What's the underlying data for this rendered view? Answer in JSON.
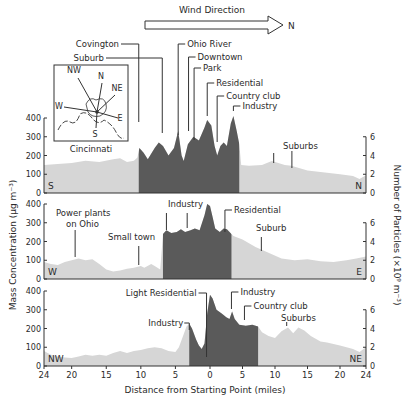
{
  "chart_data": {
    "type": "area",
    "title": "Wind Direction",
    "wind_arrow_label": "N",
    "xlabel": "Distance from Starting Point (miles)",
    "ylabel_left": "Mass Concentration (µg m⁻³)",
    "ylabel_right": "Number of Particles (×10⁹ m⁻³)",
    "x_ticks": [
      "24",
      "20",
      "15",
      "10",
      "5",
      "0",
      "5",
      "10",
      "15",
      "20",
      "24"
    ],
    "x_tick_values": [
      -24,
      -20,
      -15,
      -10,
      -5,
      0,
      5,
      10,
      15,
      20,
      24
    ],
    "y_left_ticks": [
      "0",
      "100",
      "200",
      "300",
      "400"
    ],
    "y_right_ticks": [
      "0",
      "2",
      "4",
      "6"
    ],
    "ylim_left": [
      0,
      400
    ],
    "ylim_right": [
      0,
      6
    ],
    "inset": {
      "label": "Cincinnati",
      "directions": [
        "NW",
        "N",
        "NE",
        "W",
        "E",
        "S"
      ]
    },
    "panels": [
      {
        "name": "S-N transect",
        "start_label": "S",
        "end_label": "N",
        "city_region_miles": [
          -10.3,
          4.5
        ],
        "profile": [
          [
            -24,
            150
          ],
          [
            -22,
            155
          ],
          [
            -20,
            160
          ],
          [
            -18,
            172
          ],
          [
            -16,
            165
          ],
          [
            -14,
            180
          ],
          [
            -13,
            185
          ],
          [
            -12,
            165
          ],
          [
            -11,
            172
          ],
          [
            -10.5,
            190
          ],
          [
            -10.2,
            240
          ],
          [
            -9.6,
            215
          ],
          [
            -9,
            180
          ],
          [
            -8,
            240
          ],
          [
            -7.4,
            270
          ],
          [
            -6.8,
            250
          ],
          [
            -6,
            200
          ],
          [
            -5.2,
            240
          ],
          [
            -4.6,
            330
          ],
          [
            -4.1,
            200
          ],
          [
            -3.8,
            170
          ],
          [
            -3.2,
            260
          ],
          [
            -2.4,
            300
          ],
          [
            -1.6,
            280
          ],
          [
            -0.8,
            350
          ],
          [
            -0.4,
            390
          ],
          [
            0.2,
            360
          ],
          [
            0.7,
            250
          ],
          [
            1.1,
            200
          ],
          [
            1.6,
            250
          ],
          [
            2.1,
            270
          ],
          [
            2.6,
            250
          ],
          [
            3.2,
            370
          ],
          [
            3.6,
            410
          ],
          [
            4.1,
            330
          ],
          [
            4.5,
            260
          ],
          [
            4.8,
            150
          ],
          [
            6,
            145
          ],
          [
            8,
            150
          ],
          [
            9.5,
            170
          ],
          [
            10.5,
            160
          ],
          [
            11.5,
            150
          ],
          [
            12.5,
            145
          ],
          [
            15,
            120
          ],
          [
            18,
            108
          ],
          [
            20,
            100
          ],
          [
            22,
            90
          ],
          [
            23,
            75
          ],
          [
            24,
            95
          ]
        ],
        "annotations": [
          {
            "label": "Covington",
            "x": -10.3
          },
          {
            "label": "Suburb",
            "x": -6.9
          },
          {
            "label": "Ohio River",
            "x": -4.6
          },
          {
            "label": "Downtown",
            "x": -3.1
          },
          {
            "label": "Park",
            "x": -2.3
          },
          {
            "label": "Residential",
            "x": -0.4
          },
          {
            "label": "Country club",
            "x": 1.1
          },
          {
            "label": "Industry",
            "x": 3.6
          },
          {
            "label": "Suburbs",
            "x": 9.8
          },
          {
            "label": "",
            "x": 12.6
          }
        ]
      },
      {
        "name": "W-E transect",
        "start_label": "W",
        "end_label": "E",
        "city_region_miles": [
          -6.8,
          3.3
        ],
        "profile": [
          [
            -24,
            90
          ],
          [
            -23,
            80
          ],
          [
            -22,
            75
          ],
          [
            -21,
            90
          ],
          [
            -20,
            100
          ],
          [
            -19,
            110
          ],
          [
            -18,
            100
          ],
          [
            -17,
            105
          ],
          [
            -16,
            80
          ],
          [
            -15,
            50
          ],
          [
            -14,
            40
          ],
          [
            -13,
            45
          ],
          [
            -12,
            55
          ],
          [
            -11,
            60
          ],
          [
            -10,
            70
          ],
          [
            -9.5,
            60
          ],
          [
            -8.5,
            80
          ],
          [
            -8,
            70
          ],
          [
            -7.2,
            50
          ],
          [
            -6.8,
            240
          ],
          [
            -6.3,
            260
          ],
          [
            -5.6,
            245
          ],
          [
            -4.8,
            250
          ],
          [
            -4.2,
            265
          ],
          [
            -3.6,
            250
          ],
          [
            -2.8,
            260
          ],
          [
            -2.2,
            270
          ],
          [
            -1.5,
            260
          ],
          [
            -0.8,
            340
          ],
          [
            -0.4,
            400
          ],
          [
            0,
            390
          ],
          [
            0.4,
            330
          ],
          [
            0.8,
            270
          ],
          [
            1.5,
            250
          ],
          [
            2.1,
            270
          ],
          [
            2.6,
            265
          ],
          [
            3.3,
            240
          ],
          [
            3.6,
            230
          ],
          [
            5,
            210
          ],
          [
            7,
            170
          ],
          [
            9,
            140
          ],
          [
            11,
            110
          ],
          [
            13,
            100
          ],
          [
            15,
            105
          ],
          [
            17,
            95
          ],
          [
            19,
            90
          ],
          [
            21,
            100
          ],
          [
            22.5,
            110
          ],
          [
            24,
            120
          ]
        ],
        "annotations": [
          {
            "label": "Power plants on Ohio",
            "x": -19.5
          },
          {
            "label": "Small town",
            "x": -10.3
          },
          {
            "label": "Industry",
            "x": -6.3
          },
          {
            "label": "",
            "x": -3.3
          },
          {
            "label": "Residential",
            "x": 2.3
          },
          {
            "label": "Suburb",
            "x": 7.9
          }
        ]
      },
      {
        "name": "NW-NE transect",
        "start_label": "NW",
        "end_label": "NE",
        "city_region_miles": [
          -3.0,
          7.4
        ],
        "profile": [
          [
            -24,
            80
          ],
          [
            -23,
            60
          ],
          [
            -22,
            50
          ],
          [
            -21,
            45
          ],
          [
            -20,
            42
          ],
          [
            -19,
            50
          ],
          [
            -18,
            60
          ],
          [
            -17,
            55
          ],
          [
            -16,
            60
          ],
          [
            -15,
            55
          ],
          [
            -14,
            70
          ],
          [
            -13,
            80
          ],
          [
            -12,
            70
          ],
          [
            -11,
            80
          ],
          [
            -10,
            85
          ],
          [
            -9,
            95
          ],
          [
            -8,
            100
          ],
          [
            -7,
            95
          ],
          [
            -6,
            80
          ],
          [
            -5,
            75
          ],
          [
            -4.5,
            100
          ],
          [
            -4,
            150
          ],
          [
            -3.4,
            210
          ],
          [
            -3,
            225
          ],
          [
            -2.6,
            200
          ],
          [
            -2,
            140
          ],
          [
            -1.6,
            110
          ],
          [
            -1.2,
            90
          ],
          [
            -0.8,
            120
          ],
          [
            -0.4,
            280
          ],
          [
            0,
            380
          ],
          [
            0.4,
            360
          ],
          [
            1,
            300
          ],
          [
            1.8,
            280
          ],
          [
            2.5,
            260
          ],
          [
            3,
            250
          ],
          [
            3.4,
            290
          ],
          [
            3.8,
            250
          ],
          [
            4.5,
            220
          ],
          [
            5.5,
            215
          ],
          [
            6.5,
            220
          ],
          [
            7.4,
            210
          ],
          [
            8,
            180
          ],
          [
            9,
            160
          ],
          [
            10,
            150
          ],
          [
            11,
            185
          ],
          [
            12,
            205
          ],
          [
            12.8,
            175
          ],
          [
            13.6,
            205
          ],
          [
            14.5,
            190
          ],
          [
            15.5,
            160
          ],
          [
            17,
            130
          ],
          [
            18,
            125
          ],
          [
            20,
            110
          ],
          [
            22,
            90
          ],
          [
            23,
            75
          ],
          [
            24,
            100
          ]
        ],
        "annotations": [
          {
            "label": "Industry",
            "x": -3.0
          },
          {
            "label": "Light Residential",
            "x": -0.5
          },
          {
            "label": "Industry",
            "x": 3.3
          },
          {
            "label": "Country club",
            "x": 5.3
          },
          {
            "label": "Suburbs",
            "x": 11.8
          },
          {
            "label": "",
            "x": 14.1
          }
        ]
      }
    ]
  }
}
